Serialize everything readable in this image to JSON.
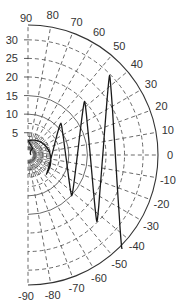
{
  "chart_data": {
    "type": "line",
    "subtype": "polar-half-plane",
    "title": "",
    "angular_axis": {
      "range": [
        -90,
        90
      ],
      "unit": "degrees",
      "tick_labels": [
        "90",
        "80",
        "70",
        "60",
        "50",
        "40",
        "30",
        "20",
        "10",
        "0",
        "-10",
        "-20",
        "-30",
        "-40",
        "-50",
        "-60",
        "-70",
        "-80",
        "-90"
      ],
      "tick_values": [
        90,
        80,
        70,
        60,
        50,
        40,
        30,
        20,
        10,
        0,
        -10,
        -20,
        -30,
        -40,
        -50,
        -60,
        -70,
        -80,
        -90
      ],
      "grid": "dashed"
    },
    "radial_axis": {
      "range": [
        0,
        34
      ],
      "tick_labels": [
        "5",
        "10",
        "15",
        "20",
        "25",
        "30"
      ],
      "tick_values": [
        5,
        10,
        15,
        20,
        25,
        30
      ],
      "grid": "dashed",
      "label_position": "left vertical axis (along 90°)"
    },
    "legend": null,
    "series": [
      {
        "name": "curve",
        "style": "solid",
        "color": "#1a1a1a",
        "description": "oscillating spiral-like curve sweeping between approx +44° and -45° with growing radius",
        "peaks": [
          {
            "angle": 0,
            "r": 0.5
          },
          {
            "angle": -48,
            "r": 6.2
          },
          {
            "angle": 44,
            "r": 11.3
          },
          {
            "angle": -43,
            "r": 15.1
          },
          {
            "angle": 43.5,
            "r": 20.0
          },
          {
            "angle": -44,
            "r": 24.8
          },
          {
            "angle": 44.3,
            "r": 29.7
          },
          {
            "angle": -45,
            "r": 34.8
          }
        ]
      }
    ]
  },
  "colors": {
    "background": "#ffffff",
    "grid": "#444444",
    "curve": "#1a1a1a",
    "text": "#333333"
  }
}
